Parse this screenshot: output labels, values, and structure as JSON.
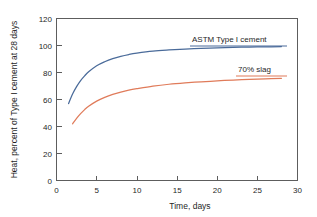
{
  "chart_data": {
    "type": "line",
    "title": "",
    "xlabel": "Time, days",
    "ylabel": "Heat, percent of Type I cement at 28 days",
    "xlim": [
      0,
      30
    ],
    "ylim": [
      0,
      120
    ],
    "xticks": [
      0,
      5,
      10,
      15,
      20,
      25,
      30
    ],
    "yticks": [
      0,
      20,
      40,
      60,
      80,
      100,
      120
    ],
    "xtick_labels": [
      "0",
      "5",
      "10",
      "15",
      "20",
      "25",
      "30"
    ],
    "ytick_labels": [
      "0",
      "20",
      "40",
      "60",
      "80",
      "100",
      "120"
    ],
    "grid": false,
    "legend_position": "inline-annotations",
    "series": [
      {
        "name": "ASTM Type I cement",
        "color": "#4a6b9a",
        "label_position": "above-right",
        "x": [
          1.5,
          2,
          2.5,
          3,
          3.5,
          4,
          5,
          6,
          7,
          8,
          9,
          10,
          12,
          14,
          16,
          18,
          20,
          22,
          24,
          26,
          28
        ],
        "y": [
          57,
          64,
          69.5,
          74,
          77.5,
          80.5,
          85,
          88,
          90.3,
          92,
          93.3,
          94.3,
          95.8,
          96.7,
          97.4,
          97.9,
          98.3,
          98.6,
          98.8,
          99,
          99.2
        ]
      },
      {
        "name": "70% slag",
        "color": "#e07b5a",
        "label_position": "above-right",
        "x": [
          2,
          2.5,
          3,
          3.5,
          4,
          5,
          6,
          7,
          8,
          9,
          10,
          12,
          14,
          16,
          18,
          20,
          22,
          24,
          26,
          28
        ],
        "y": [
          42,
          46,
          49.5,
          52.5,
          55,
          58.8,
          61.6,
          63.8,
          65.5,
          66.9,
          68,
          69.9,
          71.3,
          72.3,
          73.1,
          73.8,
          74.4,
          74.9,
          75.3,
          75.7
        ]
      }
    ]
  },
  "axes": {
    "y_axis_title": "Heat, percent of Type I cement at 28 days",
    "x_axis_title": "Time, days"
  },
  "annotations": {
    "series_one_label": "ASTM Type I cement",
    "series_two_label": "70% slag"
  },
  "colors": {
    "series_one": "#4a6b9a",
    "series_two": "#e07b5a",
    "frame": "#5d5d5d",
    "text": "#1f1f1f",
    "background": "#ffffff"
  }
}
